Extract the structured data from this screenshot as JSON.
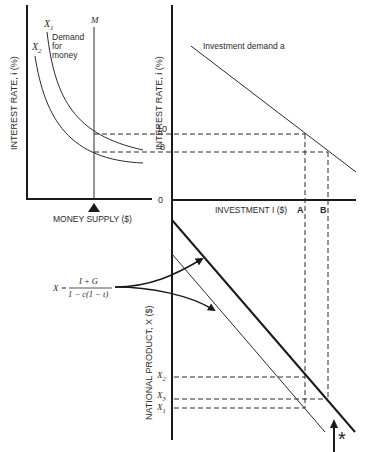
{
  "left_top_panel": {
    "y_axis_label": "INTEREST RATE, i (%)",
    "x_axis_label": "MONEY SUPPLY ($)",
    "curve_labels": [
      "X1",
      "X2"
    ],
    "curve_x1_sub": "1",
    "curve_x2_sub": "2",
    "curve_prefix": "X",
    "demand_label_1": "Demand",
    "demand_label_2": "for",
    "demand_label_3": "money",
    "supply_line_label": "M"
  },
  "right_top_panel": {
    "y_axis_label": "INTEREST RATE, i (%)",
    "x_axis_label": "INVESTMENT I ($)",
    "curve_label": "Investment demand a",
    "tick_10": "10",
    "tick_8": "8",
    "origin": "0",
    "point_a": "A",
    "point_b": "B"
  },
  "bottom_panel": {
    "y_axis_label": "NATIONAL PRODUCT, X ($)",
    "formula_lhs": "X =",
    "formula_numerator": "I + G",
    "formula_denominator": "1 − c(1 − t)",
    "x2_label": "X",
    "x2_sub": "2",
    "x3_label": "X",
    "x3_sub": "3",
    "x1_label": "X",
    "x1_sub": "1",
    "asterisk": "*"
  },
  "colors": {
    "ink": "#2a2a2a",
    "background": "#ffffff"
  }
}
